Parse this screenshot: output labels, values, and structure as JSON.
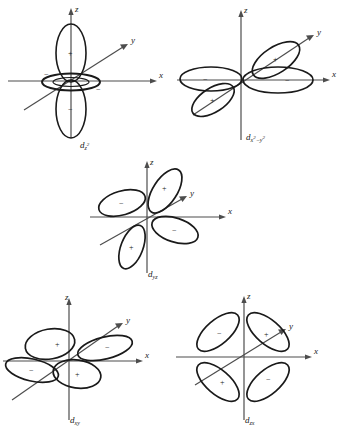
{
  "figure": {
    "background_color": "#ffffff",
    "line_color": "#1a1a1a",
    "axis_color": "#4d4d4d",
    "panel_count": 5
  },
  "axes": {
    "z_label": "z",
    "y_label": "y",
    "x_label": "x"
  },
  "signs": {
    "positive": "+",
    "negative": "−"
  },
  "orbitals": [
    {
      "id": "dz2",
      "name": "d-z-squared",
      "label_base": "d",
      "label_sub": "z",
      "label_sup": "2",
      "label_plain": "d z²",
      "shape": "two-lobes-plus-torus",
      "position": {
        "left": 0,
        "top": 0,
        "width": 173,
        "height": 152
      },
      "lobes": [
        {
          "orientation": "up-z",
          "sign": "+"
        },
        {
          "orientation": "down-z",
          "sign": "−"
        },
        {
          "orientation": "torus-left",
          "sign": "−"
        },
        {
          "orientation": "torus-right",
          "sign": "−"
        }
      ]
    },
    {
      "id": "dx2-y2",
      "name": "d-x-squared-minus-y-squared",
      "label_base": "d",
      "label_sub_parts": [
        "x",
        "2",
        "−",
        "y",
        "2"
      ],
      "label_plain": "d x²−y²",
      "shape": "four-lobes",
      "position": {
        "left": 173,
        "top": 0,
        "width": 172,
        "height": 152
      },
      "lobes": [
        {
          "orientation": "upper-right-along-y",
          "sign": "+"
        },
        {
          "orientation": "lower-left-along-y",
          "sign": "+"
        },
        {
          "orientation": "left-along-x",
          "sign": "−"
        },
        {
          "orientation": "right-along-x",
          "sign": "−"
        }
      ]
    },
    {
      "id": "dyz",
      "name": "d-yz",
      "label_base": "d",
      "label_sub": "yz",
      "label_plain": "d yz",
      "shape": "four-lobes",
      "position": {
        "left": 86,
        "top": 155,
        "width": 173,
        "height": 128
      },
      "lobes": [
        {
          "orientation": "upper-right",
          "sign": "+"
        },
        {
          "orientation": "upper-left",
          "sign": "−"
        },
        {
          "orientation": "lower-right",
          "sign": "−"
        },
        {
          "orientation": "lower-left",
          "sign": "+"
        }
      ]
    },
    {
      "id": "dxy",
      "name": "d-xy",
      "label_base": "d",
      "label_sub": "xy",
      "label_plain": "d xy",
      "shape": "four-lobes",
      "position": {
        "left": 0,
        "top": 290,
        "width": 173,
        "height": 144
      },
      "lobes": [
        {
          "orientation": "upper-left",
          "sign": "+"
        },
        {
          "orientation": "right-along-y",
          "sign": "−"
        },
        {
          "orientation": "left",
          "sign": "−"
        },
        {
          "orientation": "lower-center",
          "sign": "+"
        }
      ]
    },
    {
      "id": "dzx",
      "name": "d-zx",
      "label_base": "d",
      "label_sub": "zx",
      "label_plain": "d zx",
      "shape": "four-lobes",
      "position": {
        "left": 173,
        "top": 290,
        "width": 172,
        "height": 144
      },
      "lobes": [
        {
          "orientation": "upper-left",
          "sign": "−"
        },
        {
          "orientation": "upper-right",
          "sign": "+"
        },
        {
          "orientation": "lower-left",
          "sign": "+"
        },
        {
          "orientation": "lower-right",
          "sign": "−"
        }
      ]
    }
  ]
}
